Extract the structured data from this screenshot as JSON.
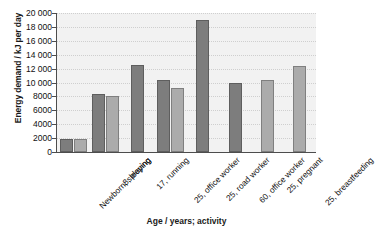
{
  "chart_data": {
    "type": "bar",
    "title": "",
    "xlabel": "Age / years; activity",
    "ylabel": "Energy demand / kJ per day",
    "ylim": [
      0,
      20000
    ],
    "ytick_labels": [
      "0",
      "2000",
      "4000",
      "6000",
      "8000",
      "10 000",
      "12 000",
      "14 000",
      "16 000",
      "18 000",
      "20 000"
    ],
    "ytick_values": [
      0,
      2000,
      4000,
      6000,
      8000,
      10000,
      12000,
      14000,
      16000,
      18000,
      20000
    ],
    "grid": true,
    "legend": "none",
    "categories": [
      "Newborn; sleeping",
      "8, playing",
      "17, running",
      "25, office worker",
      "25, road worker",
      "60, office worker",
      "25, pregnant",
      "25, breastfeeding"
    ],
    "series": [
      {
        "name": "male",
        "color": "#7d7d7d",
        "values": [
          1900,
          8400,
          12500,
          10400,
          19000,
          9900,
          null,
          null
        ]
      },
      {
        "name": "female",
        "color": "#ababab",
        "values": [
          1850,
          8050,
          null,
          9200,
          null,
          null,
          10400,
          12400
        ]
      }
    ]
  },
  "colors": {
    "plot_background": "#f2f2f2",
    "axis": "#4d4d4d",
    "grid": "#cfcfcf",
    "bar_dark": "#7d7d7d",
    "bar_light": "#ababab"
  }
}
